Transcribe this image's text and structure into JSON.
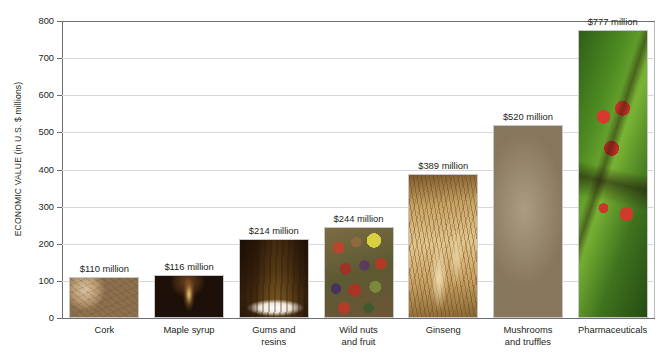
{
  "chart_data": {
    "type": "bar",
    "title": "",
    "xlabel": "",
    "ylabel": "ECONOMIC VALUE (in U.S. $ millions)",
    "ylim": [
      0,
      800
    ],
    "yticks": [
      0,
      100,
      200,
      300,
      400,
      500,
      600,
      700,
      800
    ],
    "ytick_labels": [
      "0",
      "100",
      "200",
      "300",
      "400",
      "500",
      "600",
      "700",
      "800"
    ],
    "grid": true,
    "legend": "none",
    "categories": [
      "Cork",
      "Maple syrup",
      "Gums and resins",
      "Wild nuts and fruit",
      "Ginseng",
      "Mushrooms and truffles",
      "Pharmaceuticals"
    ],
    "values": [
      110,
      116,
      214,
      244,
      389,
      520,
      777
    ],
    "value_labels": [
      "$110 million",
      "$116 million",
      "$214 million",
      "$244 million",
      "$389 million",
      "$520 million",
      "$777 million"
    ]
  },
  "bars": [
    {
      "label_line1": "Cork",
      "label_line2": "",
      "value": 110,
      "value_label": "$110 million",
      "texture": "tex-cork",
      "image_name": "cork-stoppers-photo"
    },
    {
      "label_line1": "Maple syrup",
      "label_line2": "",
      "value": 116,
      "value_label": "$116 million",
      "texture": "tex-syrup",
      "image_name": "maple-syrup-pouring-photo"
    },
    {
      "label_line1": "Gums and",
      "label_line2": "resins",
      "value": 214,
      "value_label": "$214 million",
      "texture": "tex-gums",
      "image_name": "rubber-tree-tapping-photo"
    },
    {
      "label_line1": "Wild nuts",
      "label_line2": "and fruit",
      "value": 244,
      "value_label": "$244 million",
      "texture": "tex-nuts",
      "image_name": "wild-nuts-and-fruit-photo"
    },
    {
      "label_line1": "Ginseng",
      "label_line2": "",
      "value": 389,
      "value_label": "$389 million",
      "texture": "tex-ginseng",
      "image_name": "ginseng-roots-photo"
    },
    {
      "label_line1": "Mushrooms",
      "label_line2": "and truffles",
      "value": 520,
      "value_label": "$520 million",
      "texture": "tex-mushroom",
      "image_name": "mushrooms-photo"
    },
    {
      "label_line1": "Pharmaceuticals",
      "label_line2": "",
      "value": 777,
      "value_label": "$777 million",
      "texture": "tex-pharma",
      "image_name": "red-berries-on-leaf-photo"
    }
  ],
  "colors": {
    "axis": "#6d6e71",
    "gridline": "#d6d7d9",
    "text": "#231f20",
    "background": "#ffffff"
  }
}
